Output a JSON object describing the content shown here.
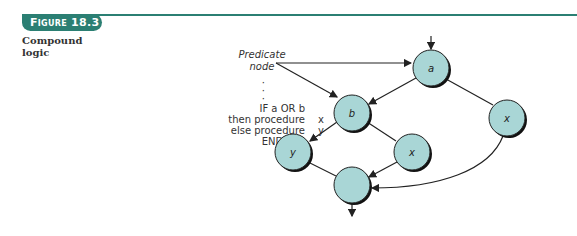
{
  "figure": {
    "tab_label": "Figure 18.3",
    "caption_lines": [
      "Compound",
      "logic"
    ],
    "accent_color": "#2b7f73"
  },
  "code": {
    "ellipsis": [
      "·",
      "·",
      "·"
    ],
    "lines": [
      {
        "text": "IF a OR b",
        "arg": ""
      },
      {
        "text": "then procedure",
        "arg": "x"
      },
      {
        "text": "else procedure",
        "arg": "y"
      },
      {
        "text": "ENDIF",
        "arg": ""
      }
    ]
  },
  "diagram": {
    "annotation": [
      "Predicate",
      "node"
    ],
    "node_fill": "#a9d6d6",
    "nodes": [
      {
        "id": "a",
        "label": "a",
        "cx": 431,
        "cy": 68
      },
      {
        "id": "b",
        "label": "b",
        "cx": 352,
        "cy": 113
      },
      {
        "id": "x_right",
        "label": "x",
        "cx": 507,
        "cy": 118
      },
      {
        "id": "y",
        "label": "y",
        "cx": 293,
        "cy": 152
      },
      {
        "id": "x_mid",
        "label": "x",
        "cx": 412,
        "cy": 152
      },
      {
        "id": "join",
        "label": "",
        "cx": 352,
        "cy": 185
      }
    ],
    "edges": [
      [
        "a",
        "b"
      ],
      [
        "a",
        "x_right"
      ],
      [
        "b",
        "y"
      ],
      [
        "b",
        "x_mid"
      ],
      [
        "y",
        "join"
      ],
      [
        "x_mid",
        "join"
      ],
      [
        "x_right",
        "join"
      ]
    ]
  }
}
